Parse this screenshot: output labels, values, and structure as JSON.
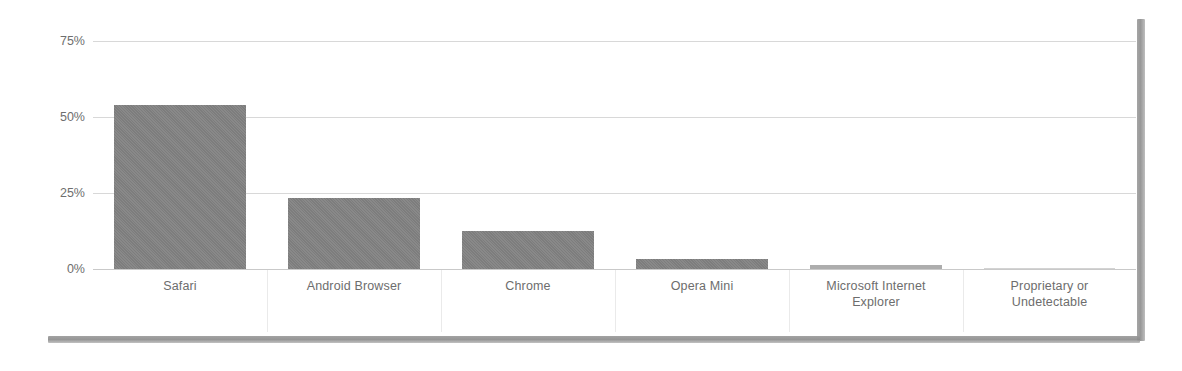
{
  "chart_data": {
    "type": "bar",
    "title": "",
    "subtitle": "",
    "xlabel": "",
    "ylabel": "",
    "categories": [
      "Safari",
      "Android Browser",
      "Chrome",
      "Opera Mini",
      "Microsoft Internet Explorer",
      "Proprietary or Undetectable"
    ],
    "values": [
      54,
      23.5,
      12.5,
      3.3,
      1.2,
      0.3
    ],
    "value_labels": [
      "54%",
      "23.5%",
      "12.5%",
      "3.3%",
      "1.2%",
      "0.3%"
    ],
    "ylim": [
      0,
      75
    ],
    "ytick_values": [
      75,
      50,
      25,
      0
    ],
    "ytick_labels": [
      "75%",
      "50%",
      "25%",
      "0%"
    ],
    "grid": true,
    "grid_axis": "y",
    "legend": false,
    "legend_position": "none",
    "bar_color": "#828282",
    "grid_color": "#d8d8d8",
    "axis_text_color": "#6d6d6d",
    "background_color": "#ffffff"
  },
  "axis": {
    "y": {
      "ticks": [
        {
          "label": "75%",
          "value": 75
        },
        {
          "label": "50%",
          "value": 50
        },
        {
          "label": "25%",
          "value": 25
        },
        {
          "label": "0%",
          "value": 0
        }
      ]
    },
    "x": {
      "categories": [
        {
          "label": "Safari",
          "line1": "Safari",
          "line2": ""
        },
        {
          "label": "Android Browser",
          "line1": "Android Browser",
          "line2": ""
        },
        {
          "label": "Chrome",
          "line1": "Chrome",
          "line2": ""
        },
        {
          "label": "Opera Mini",
          "line1": "Opera Mini",
          "line2": ""
        },
        {
          "label": "Microsoft Internet Explorer",
          "line1": "Microsoft Internet",
          "line2": "Explorer"
        },
        {
          "label": "Proprietary or Undetectable",
          "line1": "Proprietary or",
          "line2": "Undetectable"
        }
      ]
    }
  }
}
